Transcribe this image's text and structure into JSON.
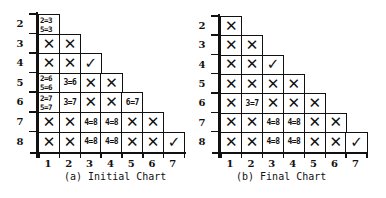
{
  "charts": [
    {
      "caption": "(a) Initial Chart",
      "row_labels": [
        "2",
        "3",
        "4",
        "5",
        "6",
        "7",
        "8"
      ],
      "col_labels": [
        "1",
        "2",
        "3",
        "4",
        "5",
        "6",
        "7"
      ],
      "rows": [
        [
          "2=3\n5=3"
        ],
        [
          "X",
          "X"
        ],
        [
          "X",
          "X",
          "✓"
        ],
        [
          "2=6\n5=6",
          "3=6",
          "X",
          "X"
        ],
        [
          "2=7\n5=7",
          "3=7",
          "X",
          "X",
          "6=7"
        ],
        [
          "X",
          "X",
          "4=8",
          "4=8",
          "X",
          "X"
        ],
        [
          "X",
          "X",
          "4=8",
          "4=8",
          "X",
          "X",
          "✓"
        ]
      ]
    },
    {
      "caption": "(b) Final Chart",
      "row_labels": [
        "2",
        "3",
        "4",
        "5",
        "6",
        "7",
        "8"
      ],
      "col_labels": [
        "1",
        "2",
        "3",
        "4",
        "5",
        "6",
        "7"
      ],
      "rows": [
        [
          "X"
        ],
        [
          "X",
          "X"
        ],
        [
          "X",
          "X",
          "✓"
        ],
        [
          "X",
          "X",
          "X",
          "X"
        ],
        [
          "X",
          "3=7",
          "X",
          "X",
          "X"
        ],
        [
          "X",
          "X",
          "4=8",
          "4=8",
          "X",
          "X"
        ],
        [
          "X",
          "X",
          "4=8",
          "4=8",
          "X",
          "X",
          "✓"
        ]
      ]
    }
  ]
}
